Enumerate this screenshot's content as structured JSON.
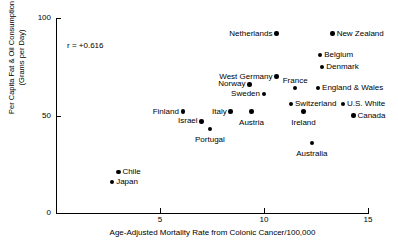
{
  "chart_data": {
    "type": "scatter",
    "title": "",
    "xlabel": "Age-Adjusted Mortality Rate from Colonic Cancer/100,000",
    "ylabel": "Per Capita Fat & Oil Consumption\n(Grams per Day)",
    "xlim": [
      0,
      15.8
    ],
    "ylim": [
      0,
      100
    ],
    "xticks": [
      5,
      10,
      15
    ],
    "xtick_labels": [
      "5",
      "10",
      "15"
    ],
    "yticks": [
      0,
      50,
      100
    ],
    "ytick_labels": [
      "0",
      "50",
      "100"
    ],
    "grid": false,
    "legend": false,
    "annotations": [
      {
        "name": "correlation",
        "text": "r = +0.616"
      }
    ],
    "point_color": "#000000",
    "axis_color": "#000000",
    "points": [
      {
        "label": "Netherlands",
        "x": 10.6,
        "y": 92,
        "label_side": "left"
      },
      {
        "label": "New Zealand",
        "x": 13.3,
        "y": 92,
        "label_side": "right"
      },
      {
        "label": "Belgium",
        "x": 12.7,
        "y": 81,
        "label_side": "right"
      },
      {
        "label": "Denmark",
        "x": 12.8,
        "y": 75,
        "label_side": "right"
      },
      {
        "label": "West Germany",
        "x": 10.6,
        "y": 70,
        "label_side": "left"
      },
      {
        "label": "Norway",
        "x": 9.3,
        "y": 66,
        "label_side": "left"
      },
      {
        "label": "France",
        "x": 11.5,
        "y": 64,
        "label_side": "above"
      },
      {
        "label": "England & Wales",
        "x": 12.6,
        "y": 64,
        "label_side": "right"
      },
      {
        "label": "Sweden",
        "x": 10.0,
        "y": 61,
        "label_side": "left"
      },
      {
        "label": "Switzerland",
        "x": 11.3,
        "y": 56,
        "label_side": "right"
      },
      {
        "label": "U.S. White",
        "x": 13.8,
        "y": 56,
        "label_side": "right"
      },
      {
        "label": "Finland",
        "x": 6.1,
        "y": 52,
        "label_side": "left"
      },
      {
        "label": "Italy",
        "x": 8.4,
        "y": 52,
        "label_side": "left"
      },
      {
        "label": "Austria",
        "x": 9.4,
        "y": 52,
        "label_side": "below"
      },
      {
        "label": "Ireland",
        "x": 11.9,
        "y": 52,
        "label_side": "below"
      },
      {
        "label": "Canada",
        "x": 14.3,
        "y": 50,
        "label_side": "right"
      },
      {
        "label": "Israel",
        "x": 7.0,
        "y": 47,
        "label_side": "left"
      },
      {
        "label": "Portugal",
        "x": 7.4,
        "y": 43,
        "label_side": "below"
      },
      {
        "label": "Australia",
        "x": 12.3,
        "y": 36,
        "label_side": "below"
      },
      {
        "label": "Chile",
        "x": 3.0,
        "y": 21,
        "label_side": "right"
      },
      {
        "label": "Japan",
        "x": 2.7,
        "y": 16,
        "label_side": "right"
      }
    ]
  }
}
